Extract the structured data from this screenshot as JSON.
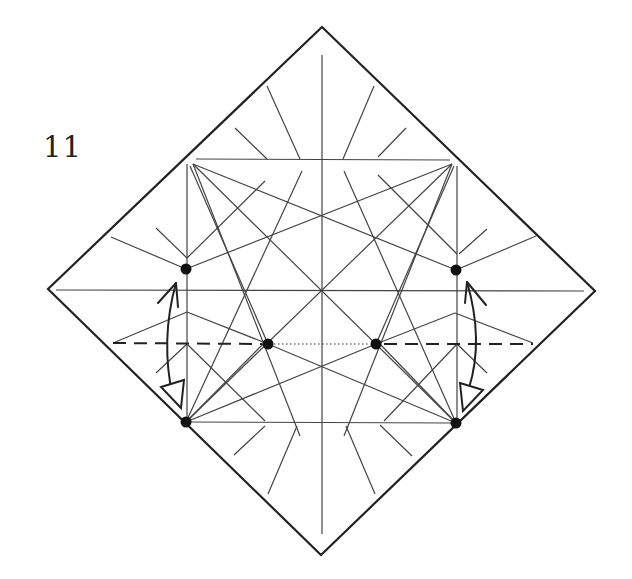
{
  "diagram": {
    "step_label": "11",
    "colors": {
      "paper": "#ffffff",
      "lines": "#222222",
      "dots": "#111111"
    },
    "paper_outline": {
      "top": [
        322,
        27
      ],
      "right": [
        595,
        291
      ],
      "bottom": [
        321,
        555
      ],
      "left": [
        48,
        289
      ]
    },
    "reference_dots": [
      {
        "name": "upper-left",
        "x": 186,
        "y": 269
      },
      {
        "name": "upper-right",
        "x": 456,
        "y": 270
      },
      {
        "name": "mid-left",
        "x": 268,
        "y": 344
      },
      {
        "name": "mid-right",
        "x": 376,
        "y": 344
      },
      {
        "name": "lower-left",
        "x": 186,
        "y": 422
      },
      {
        "name": "lower-right",
        "x": 456,
        "y": 423
      }
    ],
    "fold_lines": {
      "valley_fold_y": 344,
      "valley_left_x": [
        113,
        268
      ],
      "valley_right_x": [
        376,
        533
      ],
      "dotted_segment_x": [
        268,
        376
      ]
    },
    "arrows": [
      {
        "name": "left-fold-arrow",
        "direction": "up-and-down",
        "side": "left"
      },
      {
        "name": "right-fold-arrow",
        "direction": "up-and-down",
        "side": "right"
      }
    ]
  }
}
